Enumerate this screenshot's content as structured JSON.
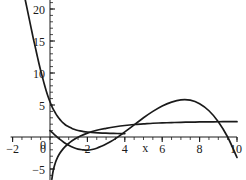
{
  "chart_data": {
    "type": "line",
    "title": "",
    "subtitle": "",
    "xlabel": "x",
    "ylabel": "",
    "xlim": [
      -2,
      10
    ],
    "ylim": [
      -7,
      22
    ],
    "grid": false,
    "legend": "none",
    "x_ticks": [
      -2,
      0,
      2,
      4,
      6,
      8,
      10
    ],
    "x_tick_labels": [
      "−2",
      "0",
      "2",
      "4",
      "6",
      "8",
      "10"
    ],
    "y_ticks": [
      -5,
      0,
      5,
      10,
      15,
      20
    ],
    "y_tick_labels": [
      "−5",
      "0",
      "5",
      "10",
      "15",
      "20"
    ],
    "x_minor_tick_step": 0.5,
    "y_minor_tick_step": 1,
    "axis_color": "#1a1a1a",
    "curve_color": "#1a1a1a",
    "background": "#ffffff",
    "series": [
      {
        "name": "decaying-curve",
        "style": "solid",
        "x": [
          -1.4,
          -1.3,
          -1.2,
          -1.1,
          -1.0,
          -0.9,
          -0.8,
          -0.7,
          -0.6,
          -0.5,
          -0.4,
          -0.3,
          -0.2,
          -0.1,
          0.0,
          0.1,
          0.2,
          0.3,
          0.4,
          0.5,
          0.6,
          0.7,
          0.8,
          0.9,
          1.0,
          1.2,
          1.4,
          1.6,
          1.8,
          2.0,
          2.4,
          2.8,
          3.2,
          3.6,
          4.0
        ],
        "y": [
          22.5,
          21.1,
          19.7,
          18.3,
          16.9,
          15.5,
          14.2,
          12.9,
          11.6,
          10.4,
          9.3,
          8.2,
          7.2,
          6.3,
          5.5,
          4.8,
          4.2,
          3.7,
          3.25,
          2.85,
          2.5,
          2.2,
          1.95,
          1.75,
          1.6,
          1.3,
          1.1,
          0.95,
          0.85,
          0.78,
          0.68,
          0.62,
          0.58,
          0.55,
          0.53
        ]
      },
      {
        "name": "log-curve",
        "style": "solid",
        "x": [
          0.1,
          0.15,
          0.2,
          0.3,
          0.4,
          0.5,
          0.7,
          0.9,
          1.2,
          1.6,
          2.0,
          2.5,
          3.0,
          3.5,
          4.0,
          4.5,
          5.0,
          5.5,
          6.0,
          6.5,
          7.0,
          7.5,
          8.0,
          8.5,
          9.0,
          9.5,
          10.0
        ],
        "y": [
          -6.6,
          -5.6,
          -4.9,
          -3.9,
          -3.2,
          -2.65,
          -1.85,
          -1.25,
          -0.55,
          0.1,
          0.6,
          1.05,
          1.35,
          1.6,
          1.8,
          1.95,
          2.05,
          2.15,
          2.2,
          2.25,
          2.3,
          2.32,
          2.35,
          2.37,
          2.38,
          2.4,
          2.4
        ]
      },
      {
        "name": "cubic-curve",
        "style": "solid",
        "x": [
          0.0,
          0.25,
          0.5,
          0.75,
          1.0,
          1.25,
          1.5,
          1.75,
          2.0,
          2.25,
          2.5,
          2.75,
          3.0,
          3.25,
          3.5,
          3.75,
          4.0,
          4.5,
          5.0,
          5.5,
          6.0,
          6.5,
          7.0,
          7.5,
          8.0,
          8.5,
          9.0,
          9.5,
          10.0
        ],
        "y": [
          1.0,
          0.35,
          -0.3,
          -0.85,
          -1.3,
          -1.65,
          -1.9,
          -2.0,
          -2.05,
          -1.95,
          -1.75,
          -1.45,
          -1.1,
          -0.7,
          -0.25,
          0.25,
          0.8,
          1.9,
          3.0,
          4.0,
          4.85,
          5.45,
          5.8,
          5.75,
          5.2,
          4.1,
          2.4,
          0.0,
          -3.2
        ]
      }
    ],
    "annotations": [
      {
        "text": "x",
        "x": 5.1,
        "y": -2.4,
        "name": "x-axis-title"
      }
    ]
  }
}
